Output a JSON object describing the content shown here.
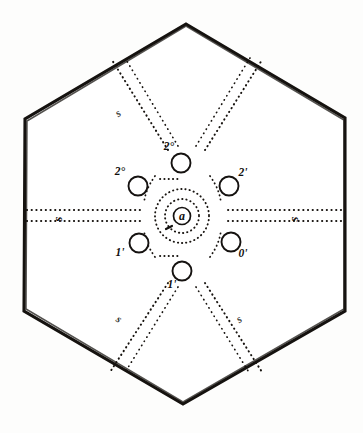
{
  "figure": {
    "kind": "hexagonal-radial-diagram",
    "background_color": "#fdfdfc",
    "ink_color": "#17130f",
    "caption": "",
    "outline": {
      "name": "hexagon-boundary",
      "shape": "hexagon",
      "orientation": "pointy-top",
      "stroke_color": "#15120f"
    },
    "center": {
      "label": "a",
      "ring_count": 2
    },
    "nodes": [
      {
        "id": "node-top",
        "label": "2°",
        "position": "top",
        "cx": 181,
        "cy": 163,
        "label_x": 169,
        "label_y": 150
      },
      {
        "id": "node-upper-right",
        "label": "2'",
        "position": "upper-right",
        "cx": 229,
        "cy": 186,
        "label_x": 243,
        "label_y": 176
      },
      {
        "id": "node-lower-right",
        "label": "0'",
        "position": "lower-right",
        "cx": 231,
        "cy": 242,
        "label_x": 243,
        "label_y": 257
      },
      {
        "id": "node-bottom",
        "label": "1'",
        "position": "bottom",
        "cx": 182,
        "cy": 271,
        "label_x": 172,
        "label_y": 288
      },
      {
        "id": "node-lower-left",
        "label": "1'",
        "position": "lower-left",
        "cx": 139,
        "cy": 243,
        "label_x": 120,
        "label_y": 256
      },
      {
        "id": "node-upper-left",
        "label": "2°",
        "position": "upper-left",
        "cx": 138,
        "cy": 186,
        "label_x": 120,
        "label_y": 175
      }
    ],
    "edge_labels": [
      {
        "id": "label-left-s",
        "text": "s",
        "x": 62,
        "y": 219
      },
      {
        "id": "label-right-s",
        "text": "s",
        "x": 298,
        "y": 219
      }
    ],
    "diagonal_labels": [
      {
        "id": "label-upper-left-diag",
        "text": "s",
        "x": 120,
        "y": 116
      },
      {
        "id": "label-lower-left-diag",
        "text": "s",
        "x": 117,
        "y": 322
      },
      {
        "id": "label-lower-right-diag",
        "text": "s",
        "x": 241,
        "y": 322
      }
    ]
  }
}
